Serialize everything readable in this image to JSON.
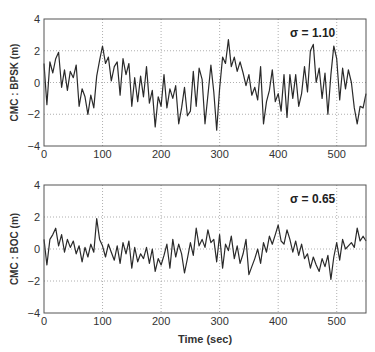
{
  "figure": {
    "xlabel": "Time (sec)"
  },
  "chart_data": [
    {
      "type": "line",
      "title": "",
      "ylabel": "CMC : BPSK (m)",
      "xlabel": "",
      "annotation": "σ = 1.10",
      "xlim": [
        0,
        550
      ],
      "ylim": [
        -4,
        4
      ],
      "xticks": [
        0,
        100,
        200,
        300,
        400,
        500
      ],
      "yticks": [
        -4,
        -2,
        0,
        2,
        4
      ],
      "grid": true,
      "series": [
        {
          "name": "CMC BPSK",
          "x": [
            0,
            5,
            10,
            15,
            20,
            25,
            30,
            35,
            40,
            45,
            50,
            55,
            60,
            65,
            70,
            75,
            80,
            85,
            90,
            95,
            100,
            105,
            110,
            115,
            120,
            125,
            130,
            135,
            140,
            145,
            150,
            155,
            160,
            165,
            170,
            175,
            180,
            185,
            190,
            195,
            200,
            205,
            210,
            215,
            220,
            225,
            230,
            235,
            240,
            245,
            250,
            255,
            260,
            265,
            270,
            275,
            280,
            285,
            290,
            295,
            300,
            305,
            310,
            315,
            320,
            325,
            330,
            335,
            340,
            345,
            350,
            355,
            360,
            365,
            370,
            375,
            380,
            385,
            390,
            395,
            400,
            405,
            410,
            415,
            420,
            425,
            430,
            435,
            440,
            445,
            450,
            455,
            460,
            465,
            470,
            475,
            480,
            485,
            490,
            495,
            500,
            505,
            510,
            515,
            520,
            525,
            530,
            535,
            540,
            545,
            550
          ],
          "values": [
            1.2,
            -1.4,
            1.3,
            0.6,
            1.5,
            1.9,
            -0.3,
            0.8,
            -0.5,
            0.7,
            0.3,
            1.1,
            -1.5,
            -0.4,
            -0.9,
            -2.0,
            -0.8,
            -1.6,
            0.4,
            1.4,
            2.3,
            1.2,
            1.6,
            0.1,
            1.0,
            1.3,
            -0.8,
            1.5,
            0.5,
            1.2,
            -1.5,
            0.3,
            -1.2,
            0.4,
            -0.9,
            1.0,
            -1.3,
            -0.5,
            -2.8,
            -0.9,
            -1.5,
            0.5,
            -1.6,
            -0.4,
            -1.0,
            -0.2,
            -2.6,
            -1.6,
            -0.3,
            -2.1,
            -1.8,
            0.7,
            -1.5,
            0.9,
            0.2,
            -2.6,
            -0.8,
            1.1,
            -0.6,
            -3.0,
            -0.4,
            1.6,
            1.2,
            2.7,
            1.0,
            1.6,
            0.7,
            1.3,
            0.6,
            -0.2,
            0.5,
            -0.8,
            -0.3,
            -1.1,
            1.0,
            -2.6,
            -1.2,
            -0.5,
            0.8,
            -1.2,
            -0.7,
            -1.8,
            0.5,
            -2.2,
            0.5,
            -1.0,
            0.5,
            -1.5,
            -0.7,
            1.0,
            -0.6,
            2.0,
            2.4,
            0.0,
            0.9,
            -1.0,
            0.6,
            -2.0,
            0.5,
            2.3,
            1.5,
            -1.1,
            0.9,
            -0.4,
            0.8,
            0.0,
            -1.6,
            -2.6,
            -1.5,
            -1.6,
            -0.7,
            -2.8,
            -1.5,
            -2.0,
            -0.3,
            -1.9,
            -2.7,
            0.7,
            0.4,
            1.2,
            -0.3,
            0.6,
            1.2,
            0.4,
            0.8,
            1.5,
            1.8,
            0.3,
            1.6,
            0.8
          ]
        }
      ]
    },
    {
      "type": "line",
      "title": "",
      "ylabel": "CMC : BOC (m)",
      "xlabel": "Time (sec)",
      "annotation": "σ = 0.65",
      "xlim": [
        0,
        550
      ],
      "ylim": [
        -4,
        4
      ],
      "xticks": [
        0,
        100,
        200,
        300,
        400,
        500
      ],
      "yticks": [
        -4,
        -2,
        0,
        2,
        4
      ],
      "grid": true,
      "series": [
        {
          "name": "CMC BOC",
          "x": [
            0,
            5,
            10,
            15,
            20,
            25,
            30,
            35,
            40,
            45,
            50,
            55,
            60,
            65,
            70,
            75,
            80,
            85,
            90,
            95,
            100,
            105,
            110,
            115,
            120,
            125,
            130,
            135,
            140,
            145,
            150,
            155,
            160,
            165,
            170,
            175,
            180,
            185,
            190,
            195,
            200,
            205,
            210,
            215,
            220,
            225,
            230,
            235,
            240,
            245,
            250,
            255,
            260,
            265,
            270,
            275,
            280,
            285,
            290,
            295,
            300,
            305,
            310,
            315,
            320,
            325,
            330,
            335,
            340,
            345,
            350,
            355,
            360,
            365,
            370,
            375,
            380,
            385,
            390,
            395,
            400,
            405,
            410,
            415,
            420,
            425,
            430,
            435,
            440,
            445,
            450,
            455,
            460,
            465,
            470,
            475,
            480,
            485,
            490,
            495,
            500,
            505,
            510,
            515,
            520,
            525,
            530,
            535,
            540,
            545,
            550
          ],
          "values": [
            0.6,
            -1.0,
            0.6,
            0.9,
            1.3,
            0.2,
            0.9,
            -0.2,
            0.6,
            0.1,
            0.5,
            -0.3,
            0.2,
            -0.8,
            0.1,
            -0.5,
            0.3,
            -0.2,
            1.9,
            0.6,
            0.2,
            -0.5,
            0.3,
            -0.2,
            -0.7,
            0.2,
            -0.9,
            0.4,
            -0.3,
            0.5,
            -1.2,
            0.1,
            -0.8,
            -0.3,
            -0.6,
            0.1,
            -0.9,
            0.0,
            -1.4,
            -0.6,
            -1.0,
            -0.4,
            0.3,
            -1.2,
            0.6,
            -0.5,
            0.3,
            -0.3,
            -1.5,
            -0.6,
            0.4,
            -0.4,
            1.3,
            0.2,
            0.6,
            0.1,
            1.2,
            0.4,
            0.6,
            -0.8,
            0.9,
            -1.2,
            0.3,
            -0.1,
            0.8,
            -0.6,
            0.2,
            -0.9,
            -0.3,
            0.6,
            -1.6,
            -1.1,
            -0.6,
            0.0,
            -0.9,
            0.4,
            -0.2,
            0.8,
            0.3,
            0.9,
            1.5,
            0.5,
            0.3,
            1.2,
            0.6,
            -0.2,
            0.5,
            -0.4,
            0.3,
            -0.6,
            -0.3,
            -1.2,
            -0.5,
            -1.0,
            -1.4,
            -0.6,
            -1.1,
            -0.4,
            -1.9,
            -0.5,
            0.4,
            -0.7,
            0.6,
            0.0,
            0.2,
            0.4,
            0.1,
            1.3,
            0.5,
            0.8,
            0.5
          ]
        }
      ]
    }
  ]
}
